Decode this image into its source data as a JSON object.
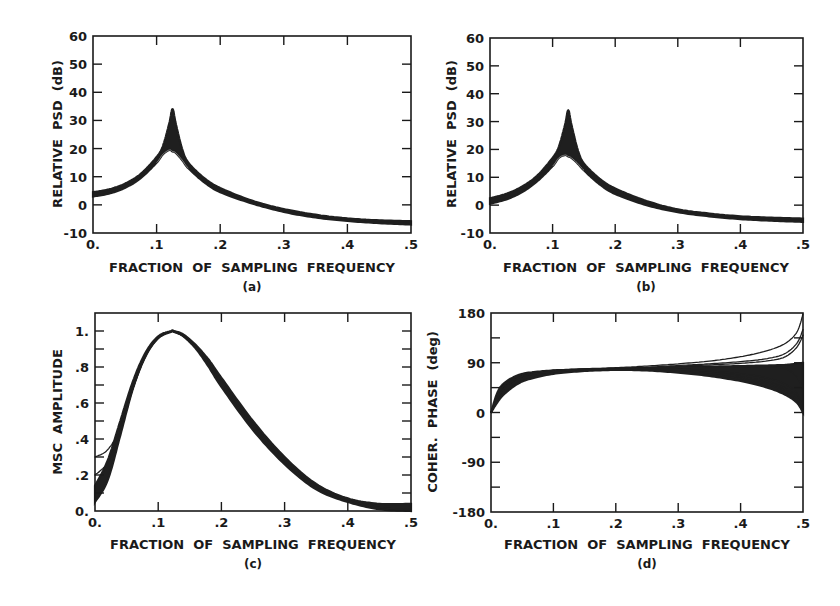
{
  "figure": {
    "panels": [
      {
        "id": "a",
        "caption": "(a)",
        "xlabel": "FRACTION  OF  SAMPLING  FREQUENCY",
        "ylabel": "RELATIVE  PSD  (dB)"
      },
      {
        "id": "b",
        "caption": "(b)",
        "xlabel": "FRACTION  OF  SAMPLING  FREQUENCY",
        "ylabel": "RELATIVE  PSD  (dB)"
      },
      {
        "id": "c",
        "caption": "(c)",
        "xlabel": "FRACTION  OF  SAMPLING  FREQUENCY",
        "ylabel": "MSC  AMPLITUDE"
      },
      {
        "id": "d",
        "caption": "(d)",
        "xlabel": "FRACTION  OF  SAMPLING  FREQUENCY",
        "ylabel": "COHER.  PHASE  (deg)"
      }
    ]
  },
  "chart_data": [
    {
      "panel": "a",
      "type": "line",
      "title": "",
      "caption": "(a)",
      "xlabel": "FRACTION OF SAMPLING FREQUENCY",
      "ylabel": "RELATIVE PSD (dB)",
      "xlim": [
        0,
        0.5
      ],
      "ylim": [
        -10,
        60
      ],
      "xticks": [
        0,
        0.1,
        0.2,
        0.3,
        0.4,
        0.5
      ],
      "xtick_labels": [
        "0.",
        ".1",
        ".2",
        ".3",
        ".4",
        ".5"
      ],
      "yticks": [
        -10,
        0,
        10,
        20,
        30,
        40,
        50,
        60
      ],
      "ytick_labels": [
        "-10",
        "0",
        "10",
        "20",
        "30",
        "40",
        "50",
        "60"
      ],
      "grid": false,
      "legend": null,
      "description": "Ensemble of overlapping PSD estimates with resonant peak near 0.125",
      "x": [
        0,
        0.025,
        0.05,
        0.075,
        0.1,
        0.11,
        0.12,
        0.125,
        0.13,
        0.14,
        0.15,
        0.175,
        0.2,
        0.25,
        0.3,
        0.35,
        0.4,
        0.45,
        0.5
      ],
      "series": [
        {
          "name": "ensemble-upper",
          "values": [
            4.5,
            5.5,
            7.5,
            11,
            17,
            21,
            29,
            34,
            29,
            20,
            15,
            9.5,
            6,
            1.5,
            -1.5,
            -3.5,
            -4.8,
            -5.5,
            -5.8
          ]
        },
        {
          "name": "ensemble-lower",
          "values": [
            3,
            4,
            6,
            9.5,
            15,
            18,
            19.5,
            19,
            18.5,
            16,
            13,
            8,
            4.5,
            0.5,
            -2.5,
            -4.5,
            -5.7,
            -6.5,
            -7
          ]
        }
      ]
    },
    {
      "panel": "b",
      "type": "line",
      "title": "",
      "caption": "(b)",
      "xlabel": "FRACTION OF SAMPLING FREQUENCY",
      "ylabel": "RELATIVE PSD (dB)",
      "xlim": [
        0,
        0.5
      ],
      "ylim": [
        -10,
        60
      ],
      "xticks": [
        0,
        0.1,
        0.2,
        0.3,
        0.4,
        0.5
      ],
      "xtick_labels": [
        "0.",
        ".1",
        ".2",
        ".3",
        ".4",
        ".5"
      ],
      "yticks": [
        -10,
        0,
        10,
        20,
        30,
        40,
        50,
        60
      ],
      "ytick_labels": [
        "-10",
        "0",
        "10",
        "20",
        "30",
        "40",
        "50",
        "60"
      ],
      "grid": false,
      "legend": null,
      "description": "Ensemble of overlapping PSD estimates with resonant peak near 0.125",
      "x": [
        0,
        0.025,
        0.05,
        0.075,
        0.1,
        0.11,
        0.12,
        0.125,
        0.13,
        0.14,
        0.15,
        0.175,
        0.2,
        0.25,
        0.3,
        0.35,
        0.4,
        0.45,
        0.5
      ],
      "series": [
        {
          "name": "ensemble-upper",
          "values": [
            2.5,
            4,
            6.5,
            10.5,
            17,
            21,
            29,
            34,
            29,
            20,
            15,
            9.5,
            6,
            1.5,
            -1.5,
            -3,
            -4,
            -4.5,
            -4.8
          ]
        },
        {
          "name": "ensemble-lower",
          "values": [
            0.5,
            2,
            4.5,
            8.5,
            14,
            17,
            18,
            17.5,
            17,
            15,
            12.5,
            7.5,
            4,
            0,
            -2.5,
            -4,
            -5,
            -5.6,
            -6
          ]
        }
      ]
    },
    {
      "panel": "c",
      "type": "line",
      "title": "",
      "caption": "(c)",
      "xlabel": "FRACTION OF SAMPLING FREQUENCY",
      "ylabel": "MSC AMPLITUDE",
      "xlim": [
        0,
        0.5
      ],
      "ylim": [
        0,
        1.1
      ],
      "xticks": [
        0,
        0.1,
        0.2,
        0.3,
        0.4,
        0.5
      ],
      "xtick_labels": [
        "0.",
        ".1",
        ".2",
        ".3",
        ".4",
        ".5"
      ],
      "yticks": [
        0,
        0.2,
        0.4,
        0.6,
        0.8,
        1.0
      ],
      "ytick_labels": [
        "0.",
        ".2",
        ".4",
        ".6",
        ".8",
        "1."
      ],
      "yminor_step": 0.1,
      "grid": false,
      "legend": null,
      "description": "Ensemble of MSC curves peaking at 1.0 near 0.125; a few curves start higher (0.2-0.3) at low frequency",
      "x": [
        0,
        0.02,
        0.04,
        0.06,
        0.08,
        0.1,
        0.12,
        0.125,
        0.14,
        0.16,
        0.18,
        0.2,
        0.25,
        0.3,
        0.35,
        0.4,
        0.45,
        0.5
      ],
      "series": [
        {
          "name": "ensemble-upper",
          "values": [
            0.14,
            0.28,
            0.5,
            0.72,
            0.88,
            0.97,
            1.0,
            1.0,
            0.98,
            0.92,
            0.84,
            0.74,
            0.5,
            0.3,
            0.15,
            0.07,
            0.04,
            0.04
          ]
        },
        {
          "name": "ensemble-lower",
          "values": [
            0.05,
            0.17,
            0.42,
            0.68,
            0.86,
            0.96,
            0.995,
            0.995,
            0.97,
            0.9,
            0.8,
            0.69,
            0.45,
            0.26,
            0.12,
            0.05,
            0.01,
            0.0
          ]
        },
        {
          "name": "outlier-1",
          "values": [
            0.3,
            0.34,
            0.46,
            0.68,
            0.86,
            0.96,
            0.995,
            0.995,
            0.97,
            0.91,
            0.82,
            0.72,
            0.48,
            0.28,
            0.14,
            0.06,
            0.02,
            0.01
          ]
        },
        {
          "name": "outlier-2",
          "values": [
            0.2,
            0.27,
            0.44,
            0.68,
            0.86,
            0.96,
            0.995,
            0.995,
            0.97,
            0.91,
            0.82,
            0.72,
            0.48,
            0.28,
            0.14,
            0.06,
            0.02,
            0.01
          ]
        }
      ]
    },
    {
      "panel": "d",
      "type": "line",
      "title": "",
      "caption": "(d)",
      "xlabel": "FRACTION OF SAMPLING FREQUENCY",
      "ylabel": "COHER. PHASE (deg)",
      "xlim": [
        0,
        0.5
      ],
      "ylim": [
        -180,
        180
      ],
      "xticks": [
        0,
        0.1,
        0.2,
        0.3,
        0.4,
        0.5
      ],
      "xtick_labels": [
        "0.",
        ".1",
        ".2",
        ".3",
        ".4",
        ".5"
      ],
      "yticks": [
        -180,
        -90,
        0,
        90,
        180
      ],
      "ytick_labels": [
        "-180",
        "-90",
        "0",
        "90",
        "180"
      ],
      "yminor_step": 45,
      "grid": false,
      "legend": null,
      "description": "Ensemble of coherence phase curves starting at 0, plateauing near 75-80 deg, fanning out near 0.5 to between 0 and 180 deg",
      "x": [
        0,
        0.01,
        0.02,
        0.04,
        0.06,
        0.1,
        0.15,
        0.2,
        0.25,
        0.3,
        0.35,
        0.4,
        0.44,
        0.47,
        0.49,
        0.5
      ],
      "series": [
        {
          "name": "ensemble-upper",
          "values": [
            0,
            35,
            52,
            66,
            72,
            76,
            78,
            79,
            80,
            82,
            83,
            84,
            85,
            86,
            88,
            90
          ]
        },
        {
          "name": "ensemble-lower",
          "values": [
            0,
            18,
            32,
            50,
            60,
            70,
            75,
            77,
            76,
            72,
            66,
            57,
            46,
            33,
            18,
            0
          ]
        },
        {
          "name": "upper-fan-1",
          "values": [
            0,
            30,
            48,
            64,
            71,
            76,
            79,
            81,
            84,
            88,
            93,
            101,
            111,
            124,
            145,
            178
          ]
        },
        {
          "name": "upper-fan-2",
          "values": [
            0,
            30,
            48,
            64,
            71,
            76,
            78,
            80,
            82,
            85,
            88,
            92,
            97,
            106,
            125,
            150
          ]
        },
        {
          "name": "upper-fan-3",
          "values": [
            0,
            30,
            48,
            64,
            71,
            76,
            78,
            80,
            81,
            84,
            86,
            89,
            93,
            100,
            118,
            140
          ]
        },
        {
          "name": "mid-fan-1",
          "values": [
            0,
            30,
            48,
            64,
            71,
            76,
            78,
            79,
            80,
            81,
            82,
            82,
            82,
            80,
            65,
            40
          ]
        },
        {
          "name": "mid-fan-2",
          "values": [
            0,
            30,
            48,
            64,
            71,
            76,
            78,
            79,
            80,
            81,
            82,
            83,
            84,
            86,
            88,
            90
          ]
        },
        {
          "name": "lower-fan-1",
          "values": [
            0,
            25,
            42,
            60,
            68,
            74,
            77,
            78,
            78,
            76,
            72,
            65,
            57,
            45,
            28,
            5
          ]
        },
        {
          "name": "lower-fan-2",
          "values": [
            0,
            25,
            42,
            60,
            68,
            74,
            77,
            78,
            77,
            74,
            69,
            61,
            52,
            40,
            22,
            3
          ]
        },
        {
          "name": "lower-fan-3",
          "values": [
            0,
            25,
            42,
            60,
            68,
            74,
            77,
            78,
            79,
            78,
            75,
            70,
            63,
            52,
            35,
            8
          ]
        }
      ]
    }
  ]
}
